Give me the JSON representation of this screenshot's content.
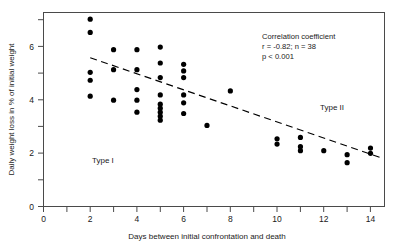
{
  "chart_data": {
    "type": "scatter",
    "title": "",
    "xlabel": "Days between initial confrontation and death",
    "ylabel": "Daily weight loss in % of initial weight",
    "xlim": [
      0,
      14.6
    ],
    "ylim": [
      0,
      7.3
    ],
    "xticks": [
      0,
      1,
      2,
      3,
      4,
      5,
      6,
      7,
      8,
      9,
      10,
      11,
      12,
      13,
      14
    ],
    "xticklabels": [
      "0",
      "",
      "2",
      "",
      "4",
      "",
      "6",
      "",
      "8",
      "",
      "10",
      "",
      "12",
      "",
      "14"
    ],
    "yticks": [
      0,
      1,
      2,
      3,
      4,
      5,
      6,
      7
    ],
    "yticklabels": [
      "0",
      "",
      "2",
      "",
      "4",
      "",
      "6",
      ""
    ],
    "grid": false,
    "legend": "none",
    "points": [
      {
        "x": 2,
        "y": 7.05
      },
      {
        "x": 2,
        "y": 6.55
      },
      {
        "x": 2,
        "y": 5.05
      },
      {
        "x": 2,
        "y": 4.75
      },
      {
        "x": 2,
        "y": 4.15
      },
      {
        "x": 3,
        "y": 5.9
      },
      {
        "x": 3,
        "y": 5.15
      },
      {
        "x": 3,
        "y": 4.0
      },
      {
        "x": 4,
        "y": 5.9
      },
      {
        "x": 4,
        "y": 5.15
      },
      {
        "x": 4,
        "y": 4.4
      },
      {
        "x": 4,
        "y": 4.0
      },
      {
        "x": 4,
        "y": 3.55
      },
      {
        "x": 5,
        "y": 6.0
      },
      {
        "x": 5,
        "y": 5.4
      },
      {
        "x": 5,
        "y": 4.85
      },
      {
        "x": 5,
        "y": 4.2
      },
      {
        "x": 5,
        "y": 3.85
      },
      {
        "x": 5,
        "y": 3.7
      },
      {
        "x": 5,
        "y": 3.55
      },
      {
        "x": 5,
        "y": 3.4
      },
      {
        "x": 5,
        "y": 3.25
      },
      {
        "x": 6,
        "y": 5.35
      },
      {
        "x": 6,
        "y": 5.1
      },
      {
        "x": 6,
        "y": 4.85
      },
      {
        "x": 6,
        "y": 4.2
      },
      {
        "x": 6,
        "y": 3.9
      },
      {
        "x": 6,
        "y": 3.5
      },
      {
        "x": 7,
        "y": 3.05
      },
      {
        "x": 8,
        "y": 4.35
      },
      {
        "x": 10,
        "y": 2.55
      },
      {
        "x": 10,
        "y": 2.35
      },
      {
        "x": 11,
        "y": 2.6
      },
      {
        "x": 11,
        "y": 2.25
      },
      {
        "x": 11,
        "y": 2.1
      },
      {
        "x": 12,
        "y": 2.1
      },
      {
        "x": 13,
        "y": 1.95
      },
      {
        "x": 13,
        "y": 1.65
      },
      {
        "x": 14,
        "y": 2.2
      },
      {
        "x": 14,
        "y": 2.0
      }
    ],
    "trendline": {
      "x0": 2.0,
      "y0": 5.6,
      "x1": 14.4,
      "y1": 1.85,
      "style": "dashed"
    },
    "annotations": {
      "correlation_heading": "Correlation coefficient",
      "correlation_values": "r = -0.82;   n = 38",
      "pvalue": "p < 0.001",
      "group_left": "Type I",
      "group_right": "Type II"
    }
  }
}
